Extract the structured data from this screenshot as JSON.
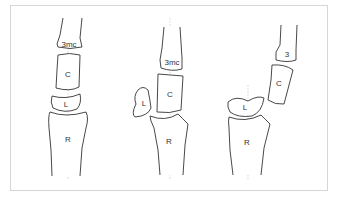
{
  "panels": [
    {
      "name": "normal",
      "labels": {
        "metacarpal": "3mc",
        "capitate": "C",
        "lunate": "L",
        "radius": "R"
      }
    },
    {
      "name": "lunate-dislocation",
      "labels": {
        "metacarpal": "3mc",
        "capitate": "C",
        "lunate": "L",
        "radius": "R"
      }
    },
    {
      "name": "perilunate-dislocation",
      "labels": {
        "metacarpal": "3",
        "capitate": "C",
        "lunate": "L",
        "radius": "R"
      }
    }
  ]
}
